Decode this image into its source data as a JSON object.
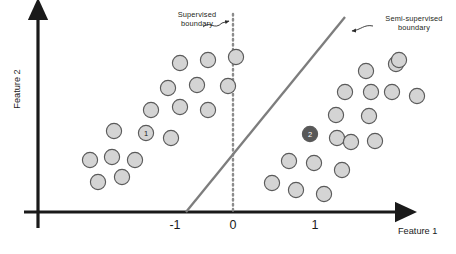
{
  "figure": {
    "background": "#ffffff"
  },
  "axes": {
    "x_title": "Feature 1",
    "y_title": "Feature 2",
    "color": "#1a1a1a",
    "origin": {
      "x": 38,
      "y": 212
    },
    "x_ticks": [
      {
        "label": "-1",
        "x": 175
      },
      {
        "label": "0",
        "x": 233
      },
      {
        "label": "1",
        "x": 315
      }
    ]
  },
  "annotations": [
    {
      "name": "supervised-boundary-label",
      "text": "Supervised\nboundary",
      "arrow_from": [
        203,
        26
      ],
      "arrow_to": [
        231,
        21
      ]
    },
    {
      "name": "semi-supervised-boundary-label",
      "text": "Semi-supervised\nboundary",
      "arrow_from": [
        372,
        27
      ],
      "arrow_to": [
        349,
        31
      ]
    }
  ],
  "boundaries": [
    {
      "name": "supervised-boundary",
      "style": "dotted",
      "color": "#8c8c8c",
      "x1": 233,
      "y1": 14,
      "x2": 233,
      "y2": 212
    },
    {
      "name": "semi-supervised-boundary",
      "style": "solid",
      "color": "#7d7d7d",
      "x1": 186,
      "y1": 212,
      "x2": 345,
      "y2": 17
    }
  ],
  "points": {
    "radius": 7.6,
    "fill": "#d4d4d4",
    "stroke": "#5a5a5a",
    "highlight_fill": "#585858",
    "highlight_text": "#ffffff",
    "label_text": "#1a1a1a",
    "class_1": [
      {
        "x": 90,
        "y": 160
      },
      {
        "x": 112,
        "y": 157
      },
      {
        "x": 135,
        "y": 160
      },
      {
        "x": 98,
        "y": 182
      },
      {
        "x": 122,
        "y": 177
      },
      {
        "x": 114,
        "y": 131
      },
      {
        "x": 146,
        "y": 133,
        "label": "1"
      },
      {
        "x": 171,
        "y": 138
      },
      {
        "x": 151,
        "y": 110
      },
      {
        "x": 180,
        "y": 107
      },
      {
        "x": 208,
        "y": 110
      },
      {
        "x": 168,
        "y": 88
      },
      {
        "x": 197,
        "y": 85
      },
      {
        "x": 228,
        "y": 86
      },
      {
        "x": 180,
        "y": 63
      },
      {
        "x": 208,
        "y": 60
      },
      {
        "x": 236,
        "y": 57
      }
    ],
    "class_2": [
      {
        "x": 272,
        "y": 183
      },
      {
        "x": 296,
        "y": 190
      },
      {
        "x": 324,
        "y": 194
      },
      {
        "x": 289,
        "y": 161
      },
      {
        "x": 314,
        "y": 163
      },
      {
        "x": 342,
        "y": 170
      },
      {
        "x": 310,
        "y": 134,
        "label": "2"
      },
      {
        "x": 337,
        "y": 138
      },
      {
        "x": 351,
        "y": 142
      },
      {
        "x": 375,
        "y": 141
      },
      {
        "x": 336,
        "y": 115
      },
      {
        "x": 369,
        "y": 116
      },
      {
        "x": 345,
        "y": 92
      },
      {
        "x": 371,
        "y": 92
      },
      {
        "x": 392,
        "y": 92
      },
      {
        "x": 417,
        "y": 96
      },
      {
        "x": 366,
        "y": 71
      },
      {
        "x": 396,
        "y": 64
      },
      {
        "x": 399,
        "y": 60
      }
    ]
  }
}
